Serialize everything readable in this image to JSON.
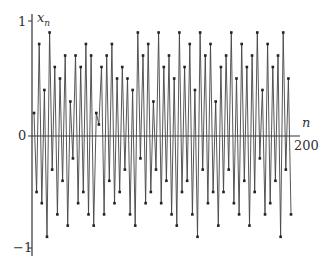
{
  "chart_data": {
    "type": "line",
    "title": "",
    "xlabel": "n",
    "ylabel": "x_n",
    "xlim": [
      0,
      200
    ],
    "ylim": [
      -1,
      1
    ],
    "x_ticks": [
      "200"
    ],
    "y_ticks": [
      "1",
      "0",
      "-1"
    ],
    "grid": false,
    "legend": null,
    "series": [
      {
        "name": "x_n",
        "note": "chaotic sequence oscillating between about -1 and 1, ~200 points",
        "values": [
          0.2,
          -0.5,
          0.8,
          -0.6,
          0.4,
          -0.9,
          0.9,
          -0.3,
          0.6,
          -0.7,
          0.5,
          -0.4,
          0.7,
          -0.8,
          0.3,
          -0.2,
          0.7,
          -0.6,
          0.6,
          -0.5,
          0.8,
          -0.7,
          0.7,
          -0.8,
          0.2,
          0.1,
          0.6,
          -0.7,
          0.7,
          -0.4,
          0.8,
          -0.6,
          0.5,
          -0.5,
          0.6,
          -0.3,
          0.5,
          -0.7,
          0.4,
          -0.8,
          0.9,
          -0.2,
          0.7,
          -0.6,
          0.8,
          -0.5,
          0.3,
          -0.3,
          0.9,
          -0.6,
          0.6,
          -0.4,
          0.7,
          -0.7,
          0.5,
          -0.8,
          0.9,
          -0.5,
          0.6,
          -0.4,
          0.8,
          -0.7,
          0.4,
          -0.9,
          0.9,
          -0.3,
          0.7,
          -0.6,
          0.8,
          -0.5,
          0.3,
          -0.8,
          0.6,
          -0.5,
          0.7,
          -0.3,
          0.9,
          -0.6,
          0.5,
          -0.7,
          0.8,
          -0.4,
          0.6,
          -0.8,
          0.7,
          -0.5,
          0.9,
          -0.2,
          0.4,
          -0.7,
          0.8,
          -0.6,
          0.6,
          -0.4,
          0.7,
          -0.9,
          0.9,
          -0.3,
          0.5,
          -0.7
        ]
      }
    ]
  },
  "labels": {
    "y_axis": "x",
    "y_axis_sub": "n",
    "x_axis": "n",
    "tick_1": "1",
    "tick_0": "0",
    "tick_m1": "−1",
    "tick_200": "200"
  }
}
